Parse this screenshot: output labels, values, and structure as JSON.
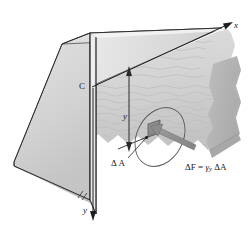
{
  "figure": {
    "kind": "engineering-mechanics-diagram",
    "labels": {
      "axis_x": "x",
      "axis_y": "y",
      "point_c": "C",
      "depth_y": "y",
      "element_area": "Δ A",
      "force_equation": "ΔF = ",
      "force_gamma": "γ",
      "force_sub_y": "y",
      "force_delta_area": " ΔA"
    },
    "colors": {
      "background": "#ffffff",
      "dam_front_face": "#d8d8d8",
      "dam_side_face": "#cfcfcf",
      "dam_top_band": "#e4e4e4",
      "dam_top_highlight": "#efefef",
      "water_surface": "#dcdcdc",
      "water_body": "#c6c6c6",
      "water_dark": "#b0b0b0",
      "element_patch": "#8a8a8a",
      "force_arrow": "#8f8f8f",
      "line_stroke": "#222222",
      "ellipse_stroke": "#555555",
      "text": "#1a1a1a"
    },
    "elements": {
      "dimension_line": "vertical depth from water surface to element",
      "ellipse": "magnification circle around element",
      "force_arrow": "delta F acting normal to the wetted face",
      "water_texture": "wavy horizontal ripples"
    }
  }
}
